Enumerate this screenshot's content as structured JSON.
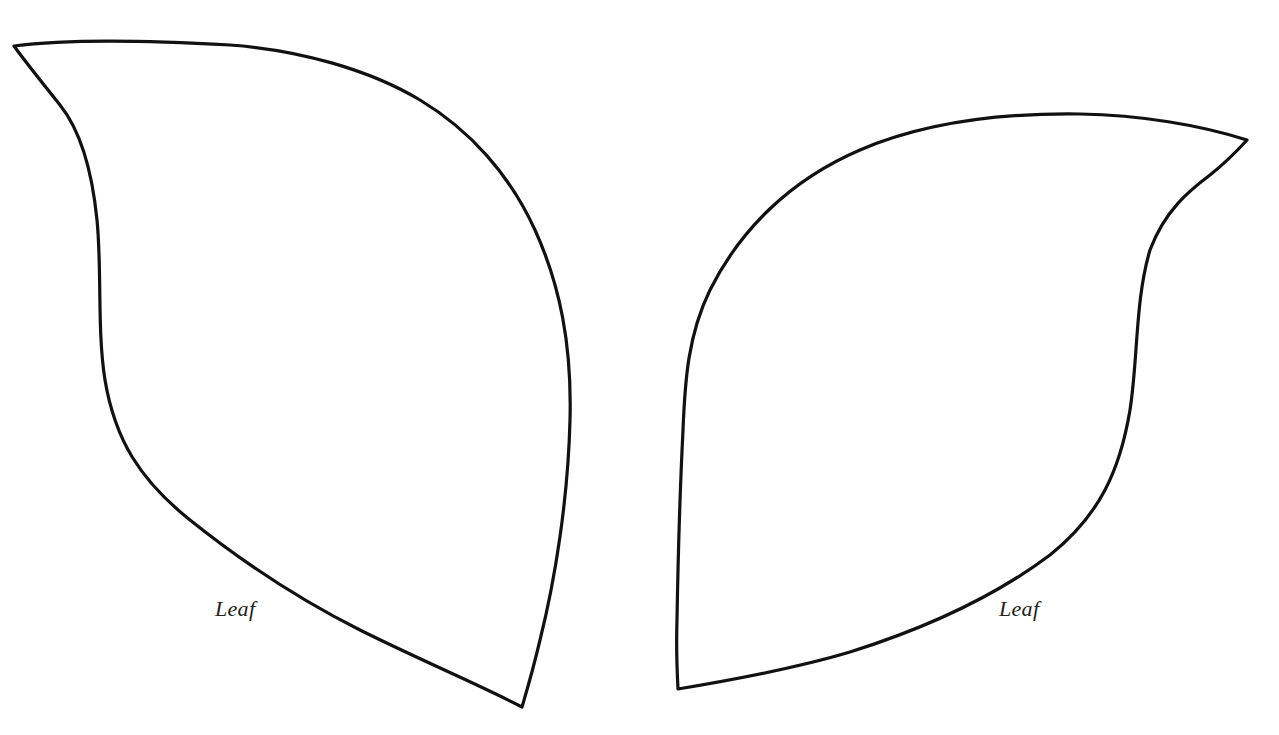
{
  "template": {
    "title": "Leaf template",
    "stroke_color": "#111111",
    "background_color": "#ffffff",
    "leaves": [
      {
        "id": "left",
        "label": "Leaf"
      },
      {
        "id": "right",
        "label": "Leaf"
      }
    ]
  }
}
